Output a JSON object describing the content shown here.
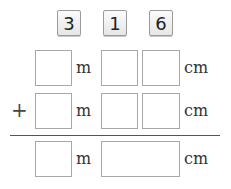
{
  "tiles": [
    "3",
    "1",
    "6"
  ],
  "rows": [
    {
      "operator": "",
      "unit_m": "m",
      "unit_cm": "cm"
    },
    {
      "operator": "+",
      "unit_m": "m",
      "unit_cm": "cm"
    },
    {
      "operator": "",
      "unit_m": "m",
      "unit_cm": "cm"
    }
  ]
}
